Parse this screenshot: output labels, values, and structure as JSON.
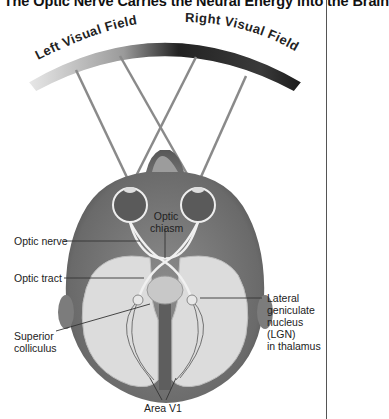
{
  "figure": {
    "title": ". The Optic Nerve Carries the Neural Energy into the Brain",
    "arc_labels": {
      "left": "Left Visual Field",
      "right": "Right Visual Field"
    },
    "labels": {
      "optic_chiasm_line1": "Optic",
      "optic_chiasm_line2": "chiasm",
      "optic_nerve": "Optic nerve",
      "optic_tract": "Optic tract",
      "superior_colliculus_line1": "Superior",
      "superior_colliculus_line2": "colliculus",
      "lgn_line1": "Lateral",
      "lgn_line2": "geniculate",
      "lgn_line3": "nucleus",
      "lgn_line4": "(LGN)",
      "lgn_line5": "in thalamus",
      "area_v1": "Area V1"
    },
    "colors": {
      "arc_dark": "#2b2b2b",
      "arc_light": "#f2f2f2",
      "head_outer": "#7a7a7a",
      "cortex_fill": "#d9d9d9",
      "ray": "#8a8a8a"
    }
  }
}
